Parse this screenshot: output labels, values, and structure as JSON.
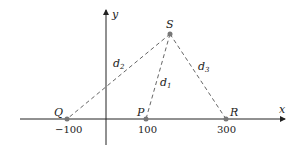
{
  "diagram": {
    "axes": {
      "x_label": "x",
      "y_label": "y"
    },
    "points": [
      {
        "id": "Q",
        "label": "Q",
        "x_value": -100,
        "tick_label": "−100"
      },
      {
        "id": "P",
        "label": "P",
        "x_value": 100,
        "tick_label": "100"
      },
      {
        "id": "R",
        "label": "R",
        "x_value": 300,
        "tick_label": "300"
      },
      {
        "id": "S",
        "label": "S"
      }
    ],
    "segments": [
      {
        "from": "S",
        "to": "P",
        "label": "d",
        "sub": "1"
      },
      {
        "from": "S",
        "to": "Q",
        "label": "d",
        "sub": "2"
      },
      {
        "from": "S",
        "to": "R",
        "label": "d",
        "sub": "3"
      }
    ],
    "colors": {
      "axis": "#222222",
      "dash": "#666666",
      "point": "#777777"
    }
  }
}
